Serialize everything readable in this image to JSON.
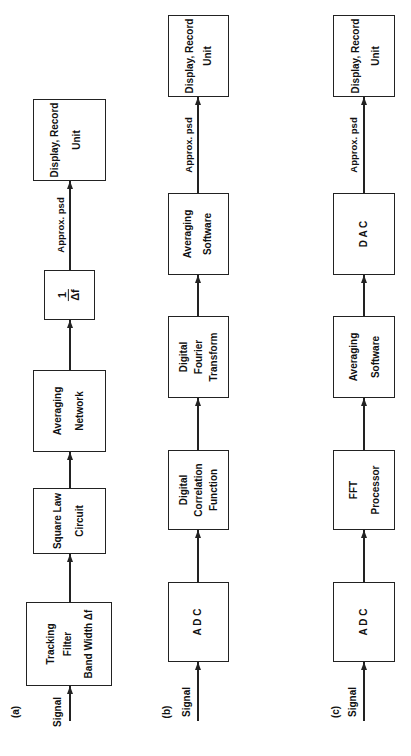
{
  "rows": {
    "a": {
      "tag": "(a)",
      "input": "Signal",
      "blocks": [
        {
          "lines": [
            "Tracking",
            "Filter",
            "Band Width Δf"
          ]
        },
        {
          "lines": [
            "Square Law",
            "Circuit"
          ]
        },
        {
          "lines": [
            "Averaging",
            "Network"
          ]
        },
        {
          "fraction": {
            "num": "1",
            "den": "Δf"
          }
        },
        {
          "lines": [
            "Display, Record",
            "Unit"
          ]
        }
      ],
      "output_label": "Approx. psd"
    },
    "b": {
      "tag": "(b)",
      "input": "Signal",
      "blocks": [
        {
          "lines": [
            "A D C"
          ]
        },
        {
          "lines": [
            "Digital",
            "Correlation",
            "Function"
          ]
        },
        {
          "lines": [
            "Digital",
            "Fourier",
            "Transform"
          ]
        },
        {
          "lines": [
            "Averaging",
            "Software"
          ]
        },
        {
          "lines": [
            "Display, Record",
            "Unit"
          ]
        }
      ],
      "output_label": "Approx. psd"
    },
    "c": {
      "tag": "(c)",
      "input": "Signal",
      "blocks": [
        {
          "lines": [
            "A D C"
          ]
        },
        {
          "lines": [
            "FFT",
            "Processor"
          ]
        },
        {
          "lines": [
            "Averaging",
            "Software"
          ]
        },
        {
          "lines": [
            "D A C"
          ]
        },
        {
          "lines": [
            "Display, Record",
            "Unit"
          ]
        }
      ],
      "output_label": "Approx. psd"
    }
  }
}
